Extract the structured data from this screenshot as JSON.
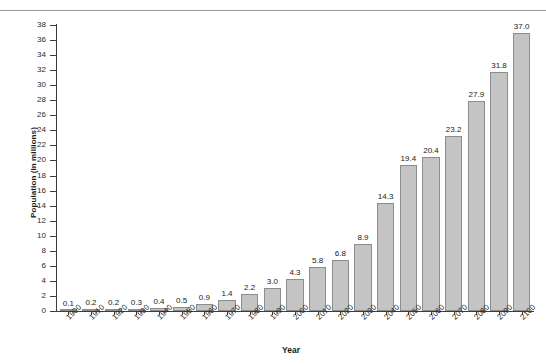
{
  "clipped_header_text": "",
  "chart_data": {
    "type": "bar",
    "title": "",
    "xlabel": "Year",
    "ylabel": "Population (in millions)",
    "categories": [
      "1900",
      "1910",
      "1920",
      "1930",
      "1940",
      "1950",
      "1960",
      "1970",
      "1980",
      "1990",
      "2000",
      "2010",
      "2020",
      "2030",
      "2040",
      "2050",
      "2060",
      "2070",
      "2080",
      "2090",
      "2100"
    ],
    "values": [
      0.1,
      0.2,
      0.2,
      0.3,
      0.4,
      0.5,
      0.9,
      1.4,
      2.2,
      3.0,
      4.3,
      5.8,
      6.8,
      8.9,
      14.3,
      19.4,
      20.4,
      23.2,
      27.9,
      31.8,
      37.0
    ],
    "value_labels": [
      "0.1",
      "0.2",
      "0.2",
      "0.3",
      "0.4",
      "0.5",
      "0.9",
      "1.4",
      "2.2",
      "3.0",
      "4.3",
      "5.8",
      "6.8",
      "8.9",
      "14.3",
      "19.4",
      "20.4",
      "23.2",
      "27.9",
      "31.8",
      "37.0"
    ],
    "ylim": [
      0,
      38
    ],
    "ytick_step": 2,
    "yticks": [
      0,
      2,
      4,
      6,
      8,
      10,
      12,
      14,
      16,
      18,
      20,
      22,
      24,
      26,
      28,
      30,
      32,
      34,
      36,
      38
    ],
    "ytick_labels": [
      "0",
      "2",
      "4",
      "6",
      "8",
      "10",
      "12",
      "14",
      "16",
      "18",
      "20",
      "22",
      "24",
      "26",
      "28",
      "30",
      "32",
      "34",
      "36",
      "38"
    ],
    "grid": false,
    "legend": false,
    "legend_position": "none",
    "bar_color": "#c4c4c4",
    "bar_edge_color": "#8d8d8d",
    "axis_color": "#3d3d3d",
    "text_color": "#1a1a1a"
  }
}
